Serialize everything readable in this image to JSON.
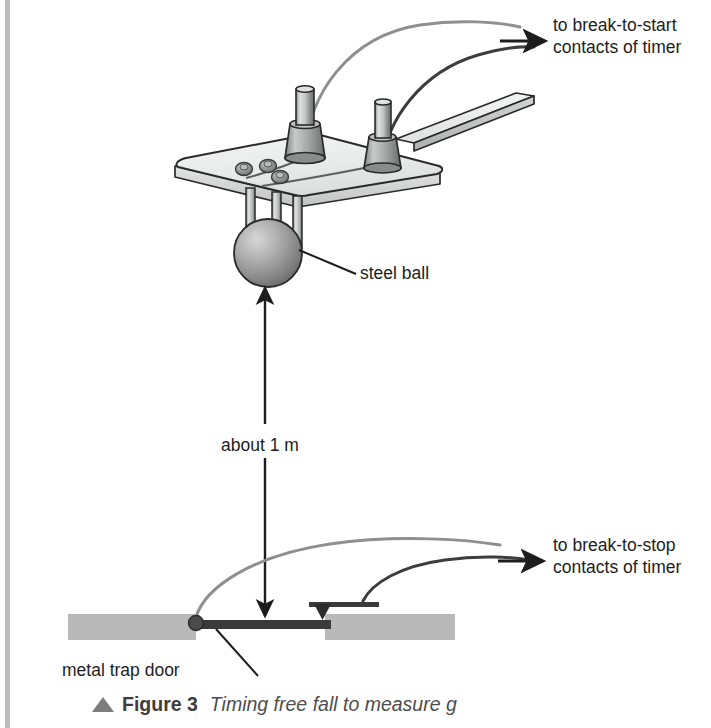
{
  "figure": {
    "marker_icon": "up-triangle-icon",
    "number_label": "Figure 3",
    "title": "Timing free fall to measure g"
  },
  "labels": {
    "break_to_start_line1": "to break-to-start",
    "break_to_start_line2": "contacts of timer",
    "break_to_stop_line1": "to break-to-stop",
    "break_to_stop_line2": "contacts of timer",
    "steel_ball": "steel ball",
    "height": "about 1 m",
    "trap_door": "metal trap door"
  },
  "diagram": {
    "type": "physics-apparatus-diagram",
    "components": [
      "release-plate",
      "terminal-post-left",
      "terminal-post-right",
      "hex-nut-contacts",
      "lever-strip",
      "ball-clamp-rods",
      "steel-ball",
      "drop-height-arrow",
      "trap-door",
      "trap-door-hinge",
      "trap-door-contact",
      "base-block-left",
      "base-block-right",
      "start-wire",
      "start-wire-secondary",
      "stop-wire",
      "stop-wire-secondary"
    ]
  },
  "colors": {
    "page_background": "#ffffff",
    "ink": "#1d1d1d",
    "outline": "#2a2a2a",
    "plate_fill": "#eceeed",
    "plate_edge": "#d6d8d7",
    "metal_light": "#d9dbda",
    "metal_mid": "#9b9d9c",
    "metal_dark": "#6e7070",
    "ball_light": "#c9cac9",
    "ball_dark": "#6b6c6b",
    "base_block": "#b9b9b9",
    "trap_door": "#3a3a3a",
    "wire_light": "#8e8f90",
    "wire_dark": "#3c3d3e",
    "margin_rule": "#a6a6a6",
    "caption_marker": "#7d7d7d",
    "caption_text": "#4a4a4a"
  }
}
